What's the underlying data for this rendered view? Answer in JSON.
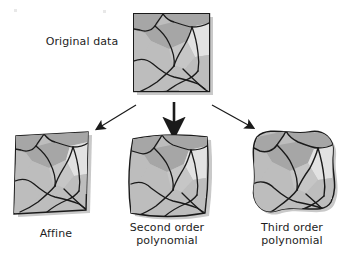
{
  "figure": {
    "kind": "diagram",
    "background_color": "#ffffff"
  },
  "nodes": {
    "original": {
      "label": "Original data",
      "icon": "raster-map-thumbnail"
    },
    "outputs": [
      {
        "id": "affine",
        "label": "Affine",
        "icon": "raster-map-thumbnail-affine"
      },
      {
        "id": "second-order",
        "label": "Second order\npolynomial",
        "icon": "raster-map-thumbnail-second-order"
      },
      {
        "id": "third-order",
        "label": "Third order\npolynomial",
        "icon": "raster-map-thumbnail-third-order"
      }
    ]
  },
  "arrows": [
    {
      "id": "arrow-left",
      "from": "original",
      "to": "affine",
      "direction": "down-left"
    },
    {
      "id": "arrow-center",
      "from": "original",
      "to": "second-order",
      "direction": "down"
    },
    {
      "id": "arrow-right",
      "from": "original",
      "to": "third-order",
      "direction": "down-right"
    }
  ],
  "colors": {
    "fill_light": "#d5d5d5",
    "fill_mid": "#bdbdbd",
    "fill_dark": "#a6a6a6",
    "fill_highlight": "#e2e2e2",
    "outline": "#1a1a1a",
    "arrow": "#1a1a1a",
    "shadow": "#c9c9c9",
    "text": "#1d1d1d",
    "background": "#ffffff"
  }
}
